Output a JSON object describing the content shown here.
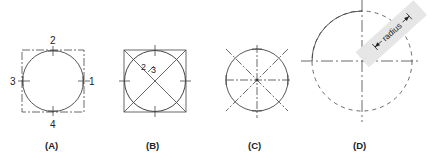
{
  "figures": [
    {
      "id": "A",
      "caption": "(A)",
      "labels": {
        "top": "2",
        "left": "3",
        "right": "1",
        "bottom": "4"
      },
      "description": "Circle inscribed in square with four tangent points numbered"
    },
    {
      "id": "B",
      "caption": "(B)",
      "labels": {
        "fraction_num": "2",
        "fraction_den": "3"
      },
      "description": "Square with diagonals, 2/3 marking along diagonal"
    },
    {
      "id": "C",
      "caption": "(C)",
      "description": "Circle with center lines and diagonal lines"
    },
    {
      "id": "D",
      "caption": "(D)",
      "labels": {
        "radius": "radius"
      },
      "description": "Large dashed circle with paper strip marked radius"
    }
  ],
  "colors": {
    "line": "#333333",
    "strip": "#e6e6e6"
  }
}
